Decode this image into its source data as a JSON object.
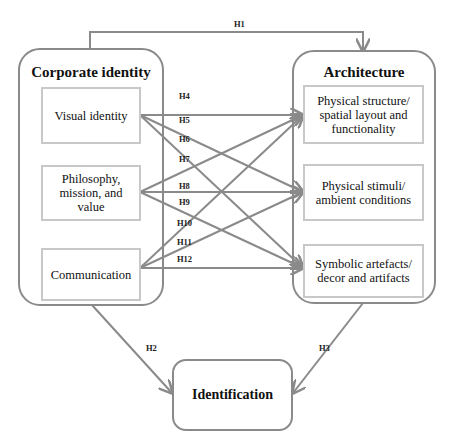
{
  "diagram": {
    "left_group": {
      "title": "Corporate identity",
      "items": [
        "Visual identity",
        "Philosophy, mission, and value",
        "Communication"
      ]
    },
    "right_group": {
      "title": "Architecture",
      "items": [
        "Physical structure/ spatial layout and functionality",
        "Physical stimuli/ ambient conditions",
        "Symbolic artefacts/ decor and artifacts"
      ]
    },
    "outcome": "Identification",
    "hypotheses": {
      "H1": "H1",
      "H2": "H2",
      "H3": "H3",
      "H4": "H4",
      "H5": "H5",
      "H6": "H6",
      "H7": "H7",
      "H8": "H8",
      "H9": "H9",
      "H10": "H10",
      "H11": "H11",
      "H12": "H12"
    },
    "edges": [
      {
        "label": "H1",
        "from": "Corporate identity",
        "to": "Architecture"
      },
      {
        "label": "H2",
        "from": "Corporate identity",
        "to": "Identification"
      },
      {
        "label": "H3",
        "from": "Architecture",
        "to": "Identification"
      },
      {
        "label": "H4",
        "from": "Visual identity",
        "to": "Physical structure/ spatial layout and functionality"
      },
      {
        "label": "H5",
        "from": "Visual identity",
        "to": "Physical stimuli/ ambient conditions"
      },
      {
        "label": "H6",
        "from": "Visual identity",
        "to": "Symbolic artefacts/ decor and artifacts"
      },
      {
        "label": "H7",
        "from": "Philosophy, mission, and value",
        "to": "Physical structure/ spatial layout and functionality"
      },
      {
        "label": "H8",
        "from": "Philosophy, mission, and value",
        "to": "Physical stimuli/ ambient conditions"
      },
      {
        "label": "H9",
        "from": "Philosophy, mission, and value",
        "to": "Symbolic artefacts/ decor and artifacts"
      },
      {
        "label": "H10",
        "from": "Communication",
        "to": "Physical structure/ spatial layout and functionality"
      },
      {
        "label": "H11",
        "from": "Communication",
        "to": "Physical stimuli/ ambient conditions"
      },
      {
        "label": "H12",
        "from": "Communication",
        "to": "Symbolic artefacts/ decor and artifacts"
      }
    ],
    "colors": {
      "outer_border": "#8a8a8a",
      "inner_border": "#c8c8c8",
      "arrow": "#8a8a8a"
    }
  }
}
